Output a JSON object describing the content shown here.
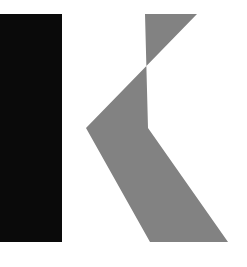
{
  "canvas": {
    "width": 247,
    "height": 267,
    "background_color": "#ffffff"
  },
  "logo": {
    "name": "K",
    "alt_text": "K",
    "wordmark_letter": "K",
    "shapes": [
      {
        "id": "stem",
        "role": "vertical-bar",
        "shape": "rectangle",
        "color": "#0a0a0a",
        "x": 0,
        "y": 14,
        "width": 62,
        "height": 228
      },
      {
        "id": "chevron",
        "role": "arm",
        "shape": "polygon",
        "color": "#828282",
        "points": "145,14 197,14 86,128 150,242 228,242 148,128"
      }
    ]
  },
  "palette": {
    "black": "#0a0a0a",
    "gray": "#828282",
    "white": "#ffffff"
  }
}
